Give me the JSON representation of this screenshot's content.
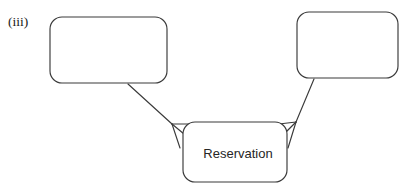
{
  "figure": {
    "caption": "(iii)",
    "background_color": "#ffffff",
    "stroke_color": "#3a3a3a",
    "text_color": "#262626"
  },
  "entities": [
    {
      "id": "left-entity",
      "name": "left-entity-box",
      "label": "",
      "x": 50,
      "y": 17,
      "width": 117,
      "height": 66,
      "corner_radius": 12
    },
    {
      "id": "right-entity",
      "name": "right-entity-box",
      "label": "",
      "x": 297,
      "y": 12,
      "width": 101,
      "height": 66,
      "corner_radius": 12
    },
    {
      "id": "reservation-entity",
      "name": "reservation-box",
      "label": "Reservation",
      "x": 183,
      "y": 122,
      "width": 104,
      "height": 60,
      "corner_radius": 12,
      "label_x": 238,
      "label_y": 155
    }
  ],
  "relationships": [
    {
      "id": "left-to-reservation",
      "name": "left-entity-to-reservation-connector",
      "from": "left-entity",
      "to": "reservation-entity",
      "cardinality": "many",
      "line": {
        "x1": 128,
        "y1": 84,
        "x2": 172,
        "y2": 124
      },
      "crowsfoot": {
        "vertex_x": 172,
        "vertex_y": 124,
        "prongs": [
          {
            "x": 190,
            "y": 124
          },
          {
            "x": 184,
            "y": 134
          },
          {
            "x": 180,
            "y": 148
          }
        ]
      }
    },
    {
      "id": "right-to-reservation",
      "name": "right-entity-to-reservation-connector",
      "from": "right-entity",
      "to": "reservation-entity",
      "cardinality": "many",
      "line": {
        "x1": 314,
        "y1": 79,
        "x2": 296,
        "y2": 122
      },
      "crowsfoot": {
        "vertex_x": 296,
        "vertex_y": 122,
        "prongs": [
          {
            "x": 279,
            "y": 124
          },
          {
            "x": 285,
            "y": 133
          },
          {
            "x": 288,
            "y": 148
          }
        ]
      }
    }
  ]
}
